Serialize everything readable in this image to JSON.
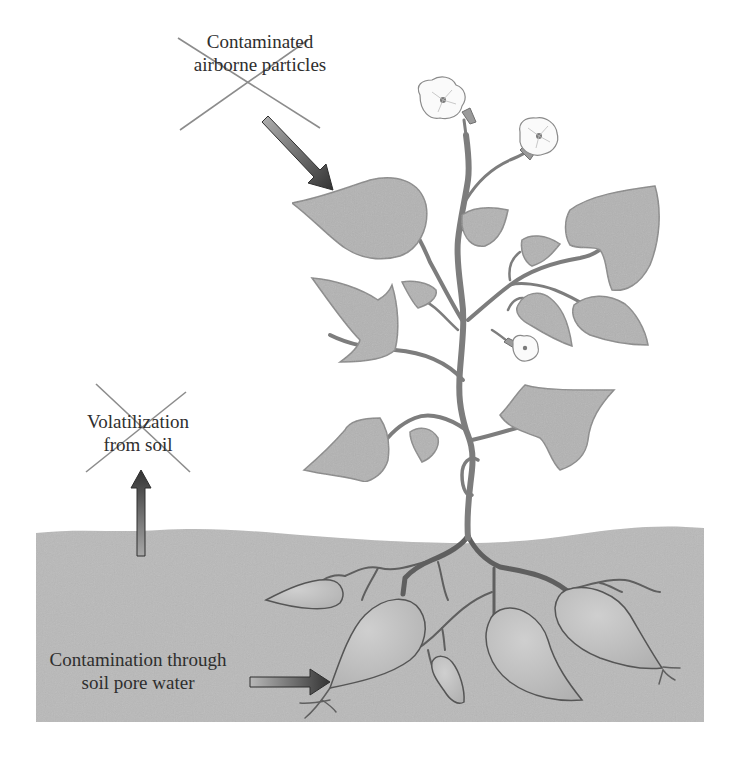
{
  "figure": {
    "type": "diagram",
    "colors": {
      "background": "#ffffff",
      "soil": "#b9b9b9",
      "leaf_fill": "#b3b3b3",
      "leaf_stroke": "#8a8a8a",
      "stem": "#7d7d7d",
      "root": "#5f5f5f",
      "tuber_fill": "#c3c3c3",
      "flower_fill": "#fafafa",
      "cross_mark": "#8c8c8c",
      "arrow_dark": "#3a3a3a",
      "arrow_light": "#a8a8a8",
      "text": "#2e2e2e"
    }
  },
  "pathways": [
    {
      "id": "airborne",
      "lines": [
        "Contaminated",
        "airborne particles"
      ],
      "crossed_out": true,
      "arrow_direction": "down-right toward leaf"
    },
    {
      "id": "volatilization",
      "lines": [
        "Volatilization",
        "from soil"
      ],
      "crossed_out": true,
      "arrow_direction": "up from soil"
    },
    {
      "id": "porewater",
      "lines": [
        "Contamination through",
        "soil pore water"
      ],
      "crossed_out": false,
      "arrow_direction": "right toward tuber root"
    }
  ]
}
